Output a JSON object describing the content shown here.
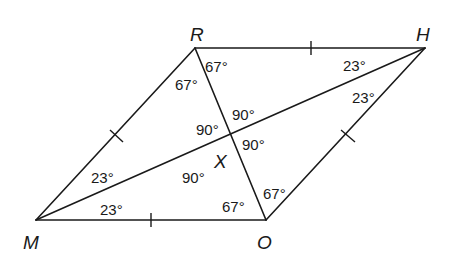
{
  "figure": {
    "type": "rhombus with diagonals",
    "vertices": {
      "R": {
        "label": "R",
        "x": 195,
        "y": 48
      },
      "H": {
        "label": "H",
        "x": 425,
        "y": 48
      },
      "O": {
        "label": "O",
        "x": 266,
        "y": 220
      },
      "M": {
        "label": "M",
        "x": 36,
        "y": 220
      }
    },
    "intersection": {
      "label": "X",
      "x": 231,
      "y": 134
    },
    "stroke_color": "#1a1a1a",
    "background": "#ffffff"
  },
  "sides": [
    {
      "from": "R",
      "to": "H",
      "tick_marks": 1
    },
    {
      "from": "H",
      "to": "O",
      "tick_marks": 1
    },
    {
      "from": "O",
      "to": "M",
      "tick_marks": 1
    },
    {
      "from": "M",
      "to": "R",
      "tick_marks": 1
    }
  ],
  "diagonals": [
    {
      "from": "R",
      "to": "O"
    },
    {
      "from": "M",
      "to": "H"
    }
  ],
  "angles": {
    "R_top": "67°",
    "R_left": "67°",
    "H_upper": "23°",
    "H_lower": "23°",
    "M_upper": "23°",
    "M_lower": "23°",
    "O_left": "67°",
    "O_right": "67°",
    "X_top": "90°",
    "X_left": "90°",
    "X_right": "90°",
    "X_bottom": "90°"
  },
  "labels": {
    "R": "R",
    "H": "H",
    "M": "M",
    "O": "O",
    "X": "X"
  }
}
